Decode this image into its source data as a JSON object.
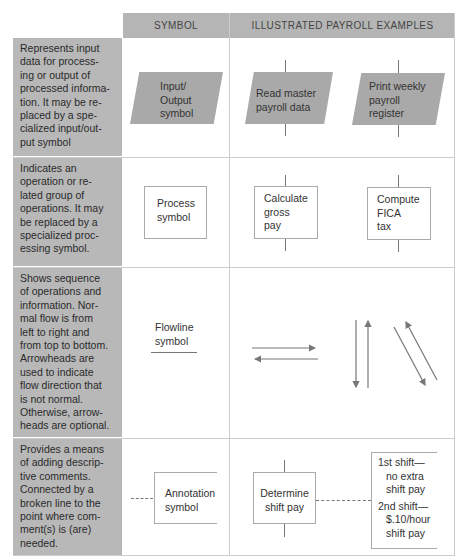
{
  "headers": {
    "symbol": "SYMBOL",
    "examples": "ILLUSTRATED PAYROLL EXAMPLES"
  },
  "rows": [
    {
      "description": "Represents input data for processing or output of processed information. It may be replaced by a specialized input/output symbol",
      "description_lines": [
        "Represents input",
        "data for process-",
        "ing or output of",
        "processed informa-",
        "tion. It may be re-",
        "placed by a spe-",
        "cialized input/out-",
        "put symbol"
      ],
      "symbol_label_lines": [
        "Input/",
        "Output",
        "symbol"
      ],
      "examples": [
        {
          "lines": [
            "Read master",
            "payroll data"
          ]
        },
        {
          "lines": [
            "Print weekly",
            "payroll",
            "register"
          ]
        }
      ]
    },
    {
      "description": "Indicates an operation or related group of operations. It may be replaced by a specialized processing symbol.",
      "description_lines": [
        "Indicates an",
        "operation or re-",
        "lated group of",
        "operations. It may",
        "be replaced by a",
        "specialized proc-",
        "essing symbol."
      ],
      "symbol_label_lines": [
        "Process",
        "symbol"
      ],
      "examples": [
        {
          "lines": [
            "Calculate",
            "gross",
            "pay"
          ]
        },
        {
          "lines": [
            "Compute",
            "FICA",
            "tax"
          ]
        }
      ]
    },
    {
      "description": "Shows sequence of operations and information. Normal flow is from left to right and from top to bottom. Arrowheads are used to indicate flow direction that is not normal. Otherwise, arrowheads are optional.",
      "description_lines": [
        "Shows sequence",
        "of operations and",
        "information. Nor-",
        "mal flow is from",
        "left to right and",
        "from top to bottom.",
        "Arrowheads are",
        "used to indicate",
        "flow direction that",
        "is not normal.",
        "Otherwise, arrow-",
        "heads are optional."
      ],
      "symbol_label_lines": [
        "Flowline",
        "symbol"
      ]
    },
    {
      "description": "Provides a means of adding descriptive comments. Connected by a broken line to the point where comment(s) is (are) needed.",
      "description_lines": [
        "Provides a means",
        "of adding descrip-",
        "tive comments.",
        "Connected by a",
        "broken line to the",
        "point where com-",
        "ment(s) is (are)",
        "needed."
      ],
      "symbol_label_lines": [
        "Annotation",
        "symbol"
      ],
      "examples": [
        {
          "lines": [
            "Determine",
            "shift pay"
          ]
        },
        {
          "lines": [
            "1st shift—",
            "no extra",
            "shift pay",
            "2nd shift—",
            "$.10/hour",
            "shift pay"
          ]
        }
      ]
    }
  ],
  "colors": {
    "header_bg": "#b5b5b5",
    "desc_bg": "#b8b8b8",
    "io_fill": "#a9a9a9",
    "line": "#777777"
  }
}
